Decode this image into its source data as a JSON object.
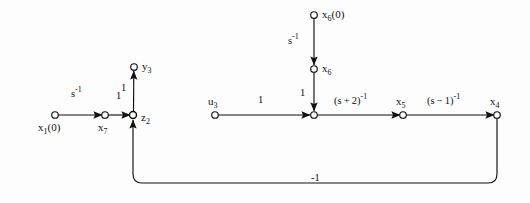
{
  "figure": {
    "type": "signal-flow-graph",
    "background_color": "#fdfdfd",
    "stroke_color": "#111111",
    "nodes": [
      {
        "id": "x1_0",
        "label": "x₁(0)",
        "label_pos": "below",
        "x": 55,
        "y": 115,
        "filled": false
      },
      {
        "id": "x7",
        "label": "x₇",
        "label_pos": "below",
        "x": 105,
        "y": 115,
        "filled": false
      },
      {
        "id": "z2",
        "label": "z₂",
        "label_pos": "right",
        "x": 133,
        "y": 115,
        "filled": true
      },
      {
        "id": "y3",
        "label": "y₃",
        "label_pos": "right",
        "x": 134,
        "y": 67,
        "filled": false
      },
      {
        "id": "x6_0",
        "label": "x₆(0)",
        "label_pos": "right",
        "x": 314,
        "y": 15,
        "filled": false
      },
      {
        "id": "x6",
        "label": "x₆",
        "label_pos": "right",
        "x": 314,
        "y": 69,
        "filled": false
      },
      {
        "id": "u3",
        "label": "u₃",
        "label_pos": "above",
        "x": 215,
        "y": 115,
        "filled": false
      },
      {
        "id": "junction",
        "label": "",
        "label_pos": "none",
        "x": 314,
        "y": 115,
        "filled": false
      },
      {
        "id": "x5",
        "label": "x₅",
        "label_pos": "above",
        "x": 403,
        "y": 115,
        "filled": false
      },
      {
        "id": "x4",
        "label": "x₄",
        "label_pos": "above",
        "x": 497,
        "y": 115,
        "filled": false
      }
    ],
    "edges": [
      {
        "from": "x1_0",
        "to": "x7",
        "gain": "s⁻¹",
        "gain_x": 78,
        "gain_y": 96,
        "direction": "right"
      },
      {
        "from": "x7",
        "to": "z2",
        "gain": "1",
        "gain_x": 119,
        "gain_y": 97,
        "direction": "right"
      },
      {
        "from": "z2",
        "to": "y3",
        "gain": "1",
        "gain_x": 124,
        "gain_y": 88,
        "direction": "up"
      },
      {
        "from": "x6_0",
        "to": "x6",
        "gain": "s⁻¹",
        "gain_x": 295,
        "gain_y": 42,
        "direction": "down"
      },
      {
        "from": "x6",
        "to": "junction",
        "gain": "1",
        "gain_x": 303,
        "gain_y": 93,
        "direction": "down"
      },
      {
        "from": "u3",
        "to": "junction",
        "gain": "1",
        "gain_x": 261,
        "gain_y": 100,
        "direction": "right"
      },
      {
        "from": "junction",
        "to": "x5",
        "gain": "(s + 2)⁻¹",
        "gain_x": 357,
        "gain_y": 102,
        "direction": "right"
      },
      {
        "from": "x5",
        "to": "x4",
        "gain": "(s − 1)⁻¹",
        "gain_x": 450,
        "gain_y": 102,
        "direction": "right"
      },
      {
        "from": "x4",
        "to": "z2",
        "gain": "-1",
        "gain_x": 318,
        "gain_y": 180,
        "direction": "feedback-up"
      }
    ],
    "feedback_path": {
      "label": "-1",
      "from_x": 497,
      "from_y": 115,
      "bottom_y": 183,
      "to_x": 133,
      "to_y": 115,
      "corner_radius": 9
    }
  }
}
